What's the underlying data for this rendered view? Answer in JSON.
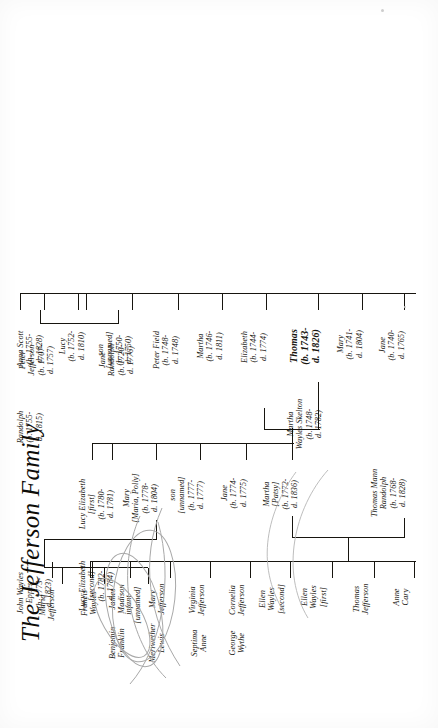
{
  "document": {
    "title": "The Jefferson Family",
    "type": "genealogical-family-tree",
    "orientation": "page rotated 90 degrees counter-clockwise",
    "ink_color": "#17150f",
    "paper_color": "#ffffff"
  },
  "generation_1": {
    "father": "Peter\nJefferson\n(b. 1707-\nd. 1757)",
    "mother": "Jane\nRandolph\n(b. 1720-\nd. 1776)"
  },
  "generation_2": [
    {
      "name": "Jane\n(b. 1740-\nd. 1765)"
    },
    {
      "name": "Mary\n(b. 1741-\nd. 1804)"
    },
    {
      "name": "Thomas\n(b. 1743-\nd. 1826)",
      "bold": true
    },
    {
      "name": "Elizabeth\n(b. 1744-\nd. 1774)"
    },
    {
      "name": "Martha\n(b. 1746-\nd. 1811)"
    },
    {
      "name": "Peter Field\n(b. 1748-\nd. 1748)"
    },
    {
      "name": "son\n[unnamed]\n(b. 1750-\nd. 1750)"
    },
    {
      "name": "Lucy\n(b. 1752-\nd. 1810)"
    },
    {
      "name": "Anna Scott\n(b. 1755-\nd. 1828)"
    },
    {
      "name": "Randolph\n(b. 1755-\nd. 1815)"
    }
  ],
  "spouse_of_thomas": "Martha\nWayles Skelton\n(b. 1748-\nd. 1782)",
  "generation_3": [
    {
      "name": "Martha\n[Patsy]\n(b. 1772-\nd. 1836)"
    },
    {
      "name": "Jane\n(b. 1774-\nd. 1775)"
    },
    {
      "name": "son\n[unnamed]\n(b. 1777-\nd. 1777)"
    },
    {
      "name": "Mary\n[Maria, Polly]\n(b. 1778-\nd. 1804)"
    },
    {
      "name": "Lucy Elizabeth\n[first]\n(b. 1780-\nd. 1781)"
    },
    {
      "name": "Lucy Elizabeth\n[second]\n(b. 1782-\nd. 1784)"
    }
  ],
  "spouse_of_martha": "Thomas Mann\nRandolph\n(b. 1768-\nd. 1828)",
  "spouse_of_mary": "John Wayles\nEppes\n(b. 1773-\nd. 1823)",
  "generation_4_randolph": [
    {
      "name": "Anne\nCary"
    },
    {
      "name": "Thomas\nJefferson"
    },
    {
      "name": "Ellen\nWayles\n[first]"
    },
    {
      "name": "Ellen\nWayles\n[second]"
    },
    {
      "name": "Cornelia\nJefferson"
    },
    {
      "name": "Virginia\nJefferson"
    },
    {
      "name": "Mary\nJefferson"
    },
    {
      "name": "James\nMadison"
    },
    {
      "name": "Benjamin\nFranklin"
    },
    {
      "name": "Meriwether\nLewis"
    },
    {
      "name": "Septima\nAnne"
    },
    {
      "name": "George\nWythe"
    }
  ],
  "generation_4_eppes": [
    {
      "name": "infant\n[unnamed]"
    },
    {
      "name": "Francis\nWayles"
    },
    {
      "name": "Maria\nJefferson"
    }
  ]
}
